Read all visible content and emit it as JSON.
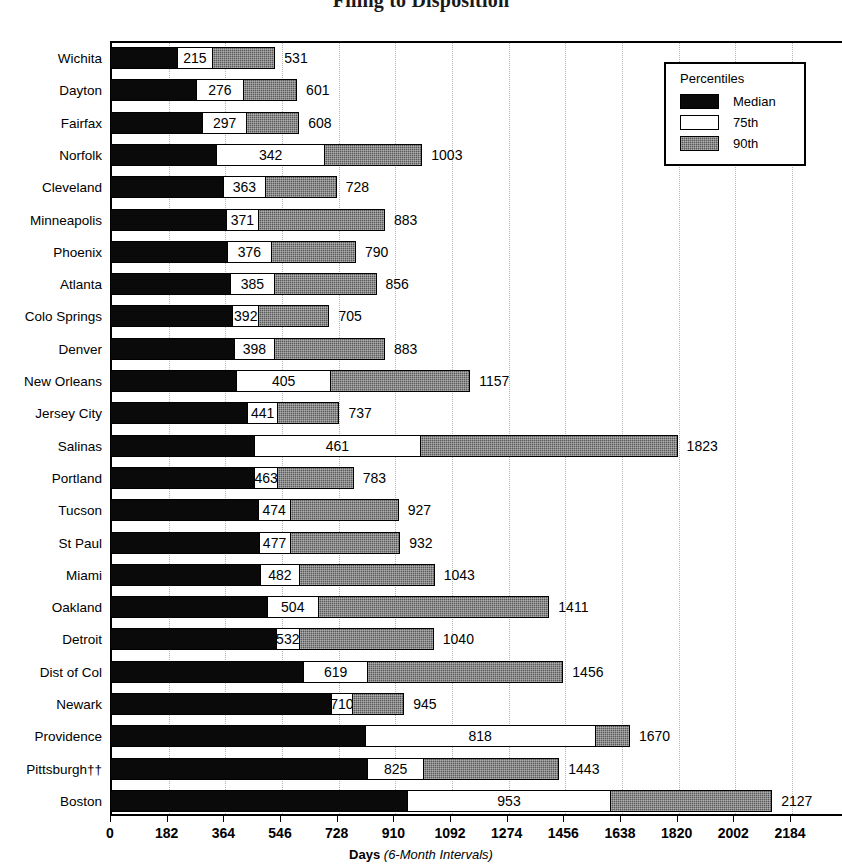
{
  "chart_data": {
    "type": "bar",
    "title": "Filing to Disposition",
    "xlabel_bold": "Days",
    "xlabel_italic": "(6-Month Intervals)",
    "ylabel": "",
    "xlim": [
      0,
      2184
    ],
    "xticks": [
      0,
      182,
      364,
      546,
      728,
      910,
      1092,
      1274,
      1456,
      1638,
      1820,
      2002,
      2184
    ],
    "grid": "vertical-dotted",
    "orientation": "horizontal",
    "legend": {
      "position": "top-right",
      "title": "Percentiles",
      "entries": [
        {
          "label": "Median",
          "swatch": "black"
        },
        {
          "label": "75th",
          "swatch": "white"
        },
        {
          "label": "90th",
          "swatch": "gray-hatched"
        }
      ]
    },
    "series": [
      {
        "name": "Median",
        "values": [
          215,
          276,
          297,
          342,
          363,
          371,
          376,
          385,
          392,
          398,
          405,
          441,
          461,
          463,
          474,
          477,
          482,
          504,
          532,
          619,
          710,
          818,
          825,
          953
        ]
      },
      {
        "name": "75th",
        "values": [
          330,
          430,
          440,
          690,
          500,
          480,
          520,
          530,
          480,
          530,
          710,
          540,
          1000,
          540,
          580,
          580,
          610,
          670,
          610,
          830,
          780,
          1560,
          1010,
          1610
        ]
      },
      {
        "name": "90th",
        "values": [
          531,
          601,
          608,
          1003,
          728,
          883,
          790,
          856,
          705,
          883,
          1157,
          737,
          1823,
          783,
          927,
          932,
          1043,
          1411,
          1040,
          1456,
          945,
          1670,
          1443,
          2127
        ]
      }
    ],
    "categories": [
      "Wichita",
      "Dayton",
      "Fairfax",
      "Norfolk",
      "Cleveland",
      "Minneapolis",
      "Phoenix",
      "Atlanta",
      "Colo Springs",
      "Denver",
      "New Orleans",
      "Jersey City",
      "Salinas",
      "Portland",
      "Tucson",
      "St Paul",
      "Miami",
      "Oakland",
      "Detroit",
      "Dist of Col",
      "Newark",
      "Providence",
      "Pittsburgh††",
      "Boston"
    ],
    "rows": [
      {
        "city": "Wichita",
        "median": 215,
        "p75": 330,
        "p90": 531
      },
      {
        "city": "Dayton",
        "median": 276,
        "p75": 430,
        "p90": 601
      },
      {
        "city": "Fairfax",
        "median": 297,
        "p75": 440,
        "p90": 608
      },
      {
        "city": "Norfolk",
        "median": 342,
        "p75": 690,
        "p90": 1003
      },
      {
        "city": "Cleveland",
        "median": 363,
        "p75": 500,
        "p90": 728
      },
      {
        "city": "Minneapolis",
        "median": 371,
        "p75": 480,
        "p90": 883
      },
      {
        "city": "Phoenix",
        "median": 376,
        "p75": 520,
        "p90": 790
      },
      {
        "city": "Atlanta",
        "median": 385,
        "p75": 530,
        "p90": 856
      },
      {
        "city": "Colo Springs",
        "median": 392,
        "p75": 480,
        "p90": 705
      },
      {
        "city": "Denver",
        "median": 398,
        "p75": 530,
        "p90": 883
      },
      {
        "city": "New Orleans",
        "median": 405,
        "p75": 710,
        "p90": 1157
      },
      {
        "city": "Jersey City",
        "median": 441,
        "p75": 540,
        "p90": 737
      },
      {
        "city": "Salinas",
        "median": 461,
        "p75": 1000,
        "p90": 1823
      },
      {
        "city": "Portland",
        "median": 463,
        "p75": 540,
        "p90": 783
      },
      {
        "city": "Tucson",
        "median": 474,
        "p75": 580,
        "p90": 927
      },
      {
        "city": "St Paul",
        "median": 477,
        "p75": 580,
        "p90": 932
      },
      {
        "city": "Miami",
        "median": 482,
        "p75": 610,
        "p90": 1043
      },
      {
        "city": "Oakland",
        "median": 504,
        "p75": 670,
        "p90": 1411
      },
      {
        "city": "Detroit",
        "median": 532,
        "p75": 610,
        "p90": 1040
      },
      {
        "city": "Dist of Col",
        "median": 619,
        "p75": 830,
        "p90": 1456
      },
      {
        "city": "Newark",
        "median": 710,
        "p75": 780,
        "p90": 945
      },
      {
        "city": "Providence",
        "median": 818,
        "p75": 1560,
        "p90": 1670
      },
      {
        "city": "Pittsburgh††",
        "median": 825,
        "p75": 1010,
        "p90": 1443
      },
      {
        "city": "Boston",
        "median": 953,
        "p75": 1610,
        "p90": 2127
      }
    ]
  },
  "colors": {
    "median": "#0a0a0a",
    "p75": "#ffffff",
    "p90": "#595959",
    "axis": "#000000",
    "grid": "#b4b4b4"
  }
}
